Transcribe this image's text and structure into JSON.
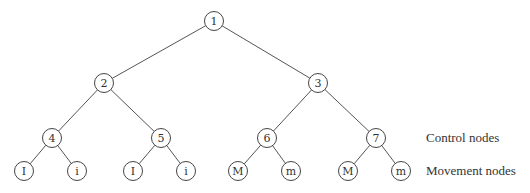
{
  "diagram": {
    "type": "binary-tree",
    "node_radius": 9.5,
    "nodes": [
      {
        "id": "n1",
        "label": "1",
        "x": 214,
        "y": 21,
        "kind": "control"
      },
      {
        "id": "n2",
        "label": "2",
        "x": 104,
        "y": 83,
        "kind": "control"
      },
      {
        "id": "n3",
        "label": "3",
        "x": 318,
        "y": 83,
        "kind": "control"
      },
      {
        "id": "n4",
        "label": "4",
        "x": 52,
        "y": 138,
        "kind": "control"
      },
      {
        "id": "n5",
        "label": "5",
        "x": 161,
        "y": 138,
        "kind": "control"
      },
      {
        "id": "n6",
        "label": "6",
        "x": 267,
        "y": 138,
        "kind": "control"
      },
      {
        "id": "n7",
        "label": "7",
        "x": 376,
        "y": 138,
        "kind": "control"
      },
      {
        "id": "l1",
        "label": "I",
        "x": 24,
        "y": 171,
        "kind": "movement"
      },
      {
        "id": "l2",
        "label": "i",
        "x": 77,
        "y": 171,
        "kind": "movement"
      },
      {
        "id": "l3",
        "label": "I",
        "x": 133,
        "y": 171,
        "kind": "movement"
      },
      {
        "id": "l4",
        "label": "i",
        "x": 186,
        "y": 171,
        "kind": "movement"
      },
      {
        "id": "l5",
        "label": "M",
        "x": 238,
        "y": 171,
        "kind": "movement"
      },
      {
        "id": "l6",
        "label": "m",
        "x": 291,
        "y": 171,
        "kind": "movement"
      },
      {
        "id": "l7",
        "label": "M",
        "x": 348,
        "y": 171,
        "kind": "movement"
      },
      {
        "id": "l8",
        "label": "m",
        "x": 401,
        "y": 171,
        "kind": "movement"
      }
    ],
    "edges": [
      [
        "n1",
        "n2"
      ],
      [
        "n1",
        "n3"
      ],
      [
        "n2",
        "n4"
      ],
      [
        "n2",
        "n5"
      ],
      [
        "n3",
        "n6"
      ],
      [
        "n3",
        "n7"
      ],
      [
        "n4",
        "l1"
      ],
      [
        "n4",
        "l2"
      ],
      [
        "n5",
        "l3"
      ],
      [
        "n5",
        "l4"
      ],
      [
        "n6",
        "l5"
      ],
      [
        "n6",
        "l6"
      ],
      [
        "n7",
        "l7"
      ],
      [
        "n7",
        "l8"
      ]
    ]
  },
  "legend": {
    "control_label": "Control nodes",
    "movement_label": "Movement nodes"
  }
}
